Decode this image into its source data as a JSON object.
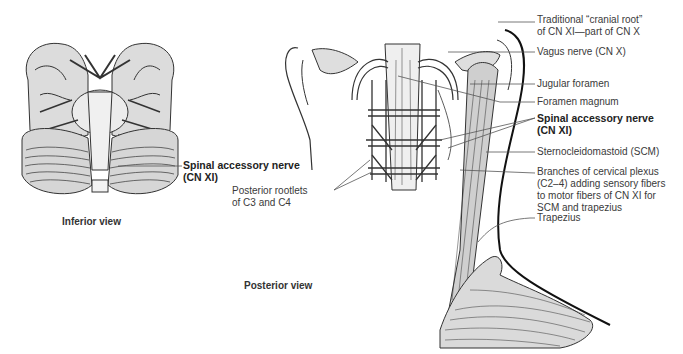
{
  "figure": {
    "panels": [
      {
        "id": "inferior",
        "caption": "Inferior view"
      },
      {
        "id": "posterior",
        "caption": "Posterior view"
      }
    ],
    "inferior_labels": {
      "spinal_accessory": {
        "line1": "Spinal accessory nerve",
        "line2": "(CN XI)"
      }
    },
    "posterior_labels": {
      "cranial_root": {
        "line1": "Traditional “cranial root”",
        "line2": "of CN XI—part of CN X"
      },
      "vagus": "Vagus nerve (CN X)",
      "jugular_foramen": "Jugular foramen",
      "foramen_magnum": "Foramen magnum",
      "spinal_accessory": {
        "line1": "Spinal accessory nerve",
        "line2": "(CN XI)"
      },
      "scm": "Sternocleidomastoid (SCM)",
      "cervical_plexus": {
        "line1": "Branches of cervical plexus",
        "line2": "(C2–4) adding sensory fibers",
        "line3": "to motor fibers of CN XI for",
        "line4": "SCM and trapezius"
      },
      "trapezius": "Trapezius",
      "posterior_rootlets": {
        "line1": "Posterior rootlets",
        "line2": "of C3 and C4"
      }
    },
    "colors": {
      "ink": "#333333",
      "leader": "#555555",
      "fill_light": "#e8e8e8",
      "fill_mid": "#c8c8c8"
    }
  }
}
